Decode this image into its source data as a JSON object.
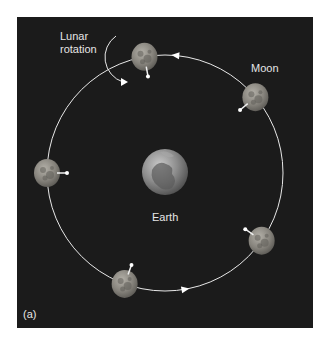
{
  "figure": {
    "panel_label": "(a)",
    "labels": {
      "lunar_rotation": [
        "Lunar",
        "rotation"
      ],
      "moon": "Moon",
      "earth": "Earth"
    },
    "colors": {
      "background": "#1b1b1b",
      "orbit": "#e8e8e8",
      "moon": "#8a8a84",
      "earth": "#7a7a7a",
      "text": "#e6e6e6"
    },
    "orbit_direction": "counterclockwise",
    "moon_positions_deg": [
      100,
      40,
      180,
      325,
      250
    ],
    "orbit_arrows_deg": [
      85,
      280
    ]
  }
}
